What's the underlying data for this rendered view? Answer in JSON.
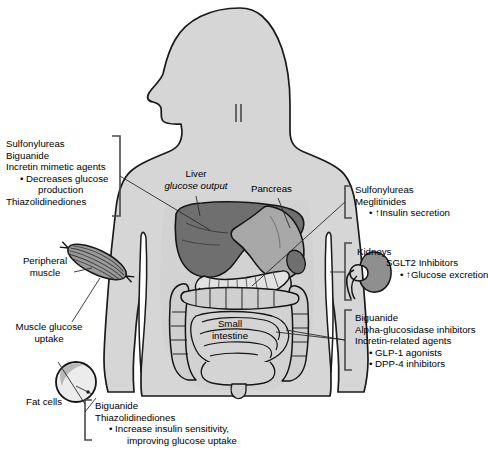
{
  "figure": {
    "type": "anatomical-diagram"
  },
  "colors": {
    "body_fill": "#d6d6d6",
    "outline": "#1a1a1a",
    "liver_fill": "#6f6f6f",
    "stomach_fill": "#a8a8a8",
    "intestine_fill": "#cfcfcf",
    "pancreas_fill": "#e2e2e2",
    "kidney_fill": "#8f8f8f",
    "muscle_fill": "#9a9a9a",
    "fat_fill": "#ececec",
    "bracket": "#3a3a3a"
  },
  "organs": {
    "liver": {
      "label": "Liver",
      "sublabel": "glucose output"
    },
    "pancreas": {
      "label": "Pancreas"
    },
    "small_intestine": {
      "label_line1": "Small",
      "label_line2": "intestine"
    },
    "kidneys": {
      "label": "Kidneys"
    },
    "peripheral_muscle": {
      "label_line1": "Peripheral",
      "label_line2": "muscle"
    },
    "muscle_uptake": {
      "label_line1": "Muscle glucose",
      "label_line2": "uptake"
    },
    "fat_cells": {
      "label": "Fat cells"
    }
  },
  "annotations": {
    "liver_block": {
      "lines": [
        "Sulfonylureas",
        "Biguanide",
        "Incretin mimetic agents"
      ],
      "bullets": [
        "• Decreases glucose",
        "   production"
      ],
      "trailing": [
        "Thiazolidinediones"
      ]
    },
    "pancreas_block": {
      "lines": [
        "Sulfonylureas",
        "Meglitinides"
      ],
      "bullets": [
        "• ↑Insulin secretion"
      ]
    },
    "kidney_block": {
      "organ_label": "Kidneys",
      "lines": [
        "SGLT2 Inhibitors"
      ],
      "bullets": [
        "• ↑Glucose excretion"
      ]
    },
    "intestine_block": {
      "lines": [
        "Biguanide",
        "Alpha-glucosidase inhibitors",
        "Incretin-related agents"
      ],
      "bullets": [
        "• GLP-1 agonists",
        "• DPP-4 inhibitors"
      ]
    },
    "fat_block": {
      "lines": [
        "Biguanide",
        "Thiazolidinediones"
      ],
      "bullets": [
        "• Increase insulin sensitivity,",
        "   improving glucose uptake"
      ]
    }
  }
}
